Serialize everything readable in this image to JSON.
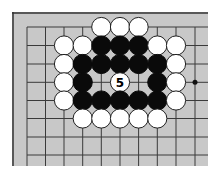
{
  "diagram": {
    "type": "go-board-fragment",
    "board_color": "#c8c8c8",
    "line_color": "#3a3a3a",
    "edge_color": "#333333",
    "background": "#ffffff",
    "edges": [
      "top",
      "left"
    ],
    "grid": {
      "columns_x": [
        27,
        45.5,
        64,
        82.7,
        101.3,
        120,
        138.6,
        157.3,
        176,
        195
      ],
      "rows_y": [
        27,
        45.5,
        64,
        82.3,
        100.5,
        118.5,
        137,
        155
      ]
    },
    "star_points": [
      {
        "col": 9,
        "row": 3
      }
    ],
    "stones": [
      {
        "col": 4,
        "row": 0,
        "color": "white"
      },
      {
        "col": 5,
        "row": 0,
        "color": "white"
      },
      {
        "col": 6,
        "row": 0,
        "color": "white"
      },
      {
        "col": 2,
        "row": 1,
        "color": "white"
      },
      {
        "col": 3,
        "row": 1,
        "color": "white"
      },
      {
        "col": 4,
        "row": 1,
        "color": "black"
      },
      {
        "col": 5,
        "row": 1,
        "color": "black"
      },
      {
        "col": 6,
        "row": 1,
        "color": "black"
      },
      {
        "col": 7,
        "row": 1,
        "color": "white"
      },
      {
        "col": 8,
        "row": 1,
        "color": "white"
      },
      {
        "col": 2,
        "row": 2,
        "color": "white"
      },
      {
        "col": 3,
        "row": 2,
        "color": "black"
      },
      {
        "col": 4,
        "row": 2,
        "color": "black"
      },
      {
        "col": 5,
        "row": 2,
        "color": "black"
      },
      {
        "col": 6,
        "row": 2,
        "color": "black"
      },
      {
        "col": 7,
        "row": 2,
        "color": "black"
      },
      {
        "col": 8,
        "row": 2,
        "color": "white"
      },
      {
        "col": 2,
        "row": 3,
        "color": "white"
      },
      {
        "col": 3,
        "row": 3,
        "color": "black"
      },
      {
        "col": 5,
        "row": 3,
        "color": "white",
        "label": "5"
      },
      {
        "col": 7,
        "row": 3,
        "color": "black"
      },
      {
        "col": 8,
        "row": 3,
        "color": "white"
      },
      {
        "col": 2,
        "row": 4,
        "color": "white"
      },
      {
        "col": 3,
        "row": 4,
        "color": "black"
      },
      {
        "col": 4,
        "row": 4,
        "color": "black"
      },
      {
        "col": 5,
        "row": 4,
        "color": "black"
      },
      {
        "col": 6,
        "row": 4,
        "color": "black"
      },
      {
        "col": 7,
        "row": 4,
        "color": "black"
      },
      {
        "col": 8,
        "row": 4,
        "color": "white"
      },
      {
        "col": 3,
        "row": 5,
        "color": "white"
      },
      {
        "col": 4,
        "row": 5,
        "color": "white"
      },
      {
        "col": 5,
        "row": 5,
        "color": "white"
      },
      {
        "col": 6,
        "row": 5,
        "color": "white"
      },
      {
        "col": 7,
        "row": 5,
        "color": "white"
      }
    ]
  }
}
